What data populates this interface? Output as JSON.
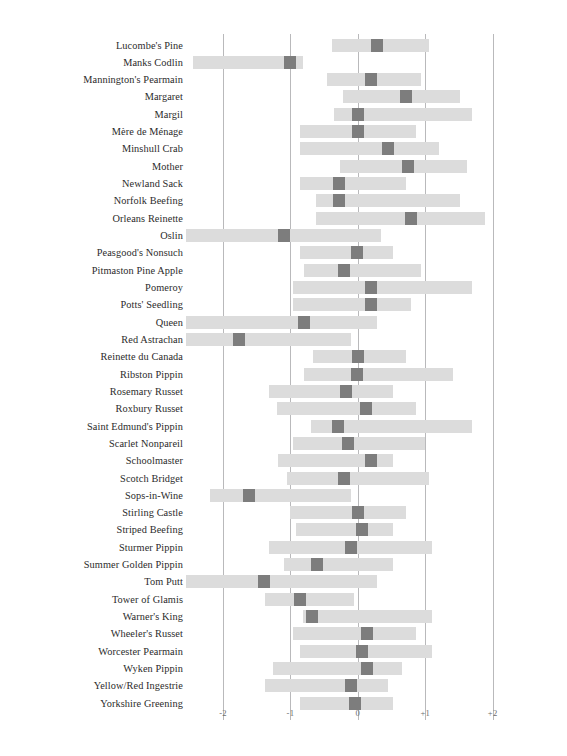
{
  "chart_data": {
    "type": "bar",
    "title": "",
    "subtitle": "",
    "xlabel": "",
    "ylabel": "",
    "xlim": [
      -2.55,
      2.45
    ],
    "grid": true,
    "grid_axis": "x",
    "legend": "none",
    "orientation": "horizontal",
    "xticks": [
      -2,
      -1,
      0,
      1,
      2
    ],
    "xticklabels": [
      "-2",
      "-1",
      "0",
      "+1",
      "+2"
    ],
    "colors": {
      "range_bar": "#dcdcdc",
      "marker": "#7d7d7d",
      "gridline": "#b9b9bb",
      "label_text": "#2b2b2b",
      "tick_text": "#6d6d6d",
      "background": "#ffffff"
    },
    "categories": [
      "Lucombe's Pine",
      "Manks Codlin",
      "Mannington's Pearmain",
      "Margaret",
      "Margil",
      "Mère de Ménage",
      "Minshull Crab",
      "Mother",
      "Newland Sack",
      "Norfolk Beefing",
      "Orleans Reinette",
      "Oslin",
      "Peasgood's Nonsuch",
      "Pitmaston Pine Apple",
      "Pomeroy",
      "Potts' Seedling",
      "Queen",
      "Red Astrachan",
      "Reinette du Canada",
      "Ribston Pippin",
      "Rosemary Russet",
      "Roxbury Russet",
      "Saint Edmund's Pippin",
      "Scarlet Nonpareil",
      "Schoolmaster",
      "Scotch Bridget",
      "Sops-in-Wine",
      "Stirling Castle",
      "Striped Beefing",
      "Sturmer Pippin",
      "Summer Golden Pippin",
      "Tom Putt",
      "Tower of Glamis",
      "Warner's King",
      "Wheeler's Russet",
      "Worcester Pearmain",
      "Wyken Pippin",
      "Yellow/Red Ingestrie",
      "Yorkshire Greening"
    ],
    "series": [
      {
        "name": "range",
        "type": "range",
        "values": [
          [
            -0.38,
            1.05
          ],
          [
            -2.45,
            -0.82
          ],
          [
            -0.46,
            0.93
          ],
          [
            -0.22,
            1.52
          ],
          [
            -0.36,
            1.7
          ],
          [
            -0.86,
            0.86
          ],
          [
            -0.86,
            1.21
          ],
          [
            -0.26,
            1.62
          ],
          [
            -0.86,
            0.72
          ],
          [
            -0.62,
            1.52
          ],
          [
            -0.62,
            1.88
          ],
          [
            -2.55,
            0.34
          ],
          [
            -0.86,
            0.52
          ],
          [
            -0.8,
            0.93
          ],
          [
            -0.96,
            1.7
          ],
          [
            -0.96,
            0.79
          ],
          [
            -2.55,
            0.28
          ],
          [
            -2.55,
            -0.1
          ],
          [
            -0.66,
            0.72
          ],
          [
            -0.8,
            1.41
          ],
          [
            -1.32,
            0.52
          ],
          [
            -1.2,
            0.86
          ],
          [
            -0.7,
            1.7
          ],
          [
            -0.96,
            1.0
          ],
          [
            -1.18,
            0.52
          ],
          [
            -1.05,
            1.05
          ],
          [
            -2.2,
            -0.1
          ],
          [
            -1.0,
            0.72
          ],
          [
            -0.92,
            0.52
          ],
          [
            -1.32,
            1.1
          ],
          [
            -1.1,
            0.52
          ],
          [
            -2.55,
            0.28
          ],
          [
            -1.38,
            -0.05
          ],
          [
            -0.82,
            1.1
          ],
          [
            -0.96,
            0.86
          ],
          [
            -0.86,
            1.1
          ],
          [
            -1.26,
            0.66
          ],
          [
            -1.38,
            0.45
          ],
          [
            -0.86,
            0.52
          ]
        ]
      },
      {
        "name": "marker",
        "type": "point",
        "values": [
          0.28,
          -1.0,
          0.2,
          0.72,
          0.0,
          0.0,
          0.44,
          0.74,
          -0.28,
          -0.28,
          0.79,
          -1.1,
          -0.02,
          -0.2,
          0.2,
          0.2,
          -0.8,
          -1.76,
          0.0,
          -0.02,
          -0.18,
          0.12,
          -0.3,
          -0.14,
          0.2,
          -0.2,
          -1.62,
          0.0,
          0.06,
          -0.1,
          -0.6,
          -1.4,
          -0.86,
          -0.68,
          0.14,
          0.06,
          0.14,
          -0.1,
          -0.04
        ]
      }
    ]
  }
}
